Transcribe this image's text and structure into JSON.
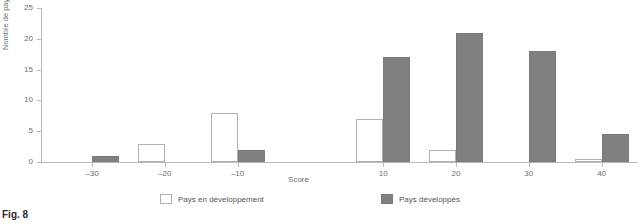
{
  "caption": "Fig. 8",
  "chart_data": {
    "type": "bar",
    "title": "",
    "xlabel": "Score",
    "ylabel": "Nombre de pays",
    "ylim": [
      0,
      25
    ],
    "yticks": [
      0,
      5,
      10,
      15,
      20,
      25
    ],
    "xticks": [
      -30,
      -20,
      -10,
      10,
      20,
      30,
      40
    ],
    "xtick_labels": [
      "–30",
      "–20",
      "–10",
      "10",
      "20",
      "30",
      "40"
    ],
    "grid": false,
    "legend_position": "bottom",
    "categories": [
      "–30",
      "–20",
      "–10",
      "10",
      "20",
      "30",
      "40"
    ],
    "series": [
      {
        "name": "Pays en développement",
        "color": "#ffffff",
        "values": [
          0,
          3,
          8,
          7,
          2,
          0,
          0.5
        ]
      },
      {
        "name": "Pays développés",
        "color": "#808080",
        "values": [
          1,
          0,
          2,
          17,
          21,
          18,
          4.5
        ]
      }
    ]
  },
  "axes": {
    "y_ticks": [
      {
        "value": 25,
        "label": "25"
      },
      {
        "value": 20,
        "label": "20"
      },
      {
        "value": 15,
        "label": "15"
      },
      {
        "value": 10,
        "label": "10"
      },
      {
        "value": 5,
        "label": "5"
      },
      {
        "value": 0,
        "label": "0"
      }
    ],
    "x_ticks": [
      {
        "value": -30,
        "label": "–30"
      },
      {
        "value": -20,
        "label": "–20"
      },
      {
        "value": -10,
        "label": "–10"
      },
      {
        "value": 10,
        "label": "10"
      },
      {
        "value": 20,
        "label": "20"
      },
      {
        "value": 30,
        "label": "30"
      },
      {
        "value": 40,
        "label": "40"
      }
    ],
    "x_title": "Score",
    "y_title": "Nombre de pays"
  },
  "legend": {
    "developing": "Pays en développement",
    "developed": "Pays développés"
  }
}
